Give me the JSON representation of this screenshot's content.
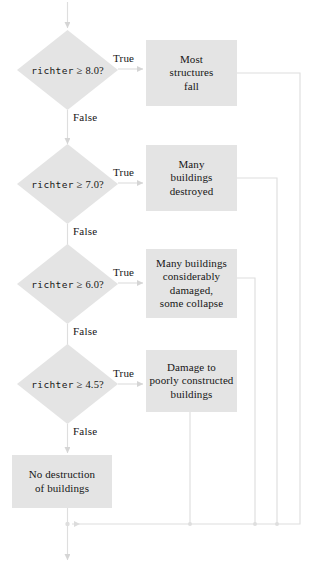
{
  "diagram": {
    "type": "flowchart",
    "colors": {
      "node_fill": "#e4e4e4",
      "edge_stroke": "#d8d8d8",
      "text": "#161616",
      "background": "#ffffff"
    },
    "decisions": [
      {
        "id": "d1",
        "variable": "richter",
        "operator": "≥",
        "threshold": "8.0?",
        "text": "richter ≥ 8.0?"
      },
      {
        "id": "d2",
        "variable": "richter",
        "operator": "≥",
        "threshold": "7.0?",
        "text": "richter ≥ 7.0?"
      },
      {
        "id": "d3",
        "variable": "richter",
        "operator": "≥",
        "threshold": "6.0?",
        "text": "richter ≥ 6.0?"
      },
      {
        "id": "d4",
        "variable": "richter",
        "operator": "≥",
        "threshold": "4.5?",
        "text": "richter ≥ 4.5?"
      }
    ],
    "outcomes": [
      {
        "id": "o1",
        "lines": [
          "Most",
          "structures",
          "fall"
        ]
      },
      {
        "id": "o2",
        "lines": [
          "Many",
          "buildings",
          "destroyed"
        ]
      },
      {
        "id": "o3",
        "lines": [
          "Many buildings",
          "considerably",
          "damaged,",
          "some collapse"
        ]
      },
      {
        "id": "o4",
        "lines": [
          "Damage to",
          "poorly constructed",
          "buildings"
        ]
      },
      {
        "id": "o5",
        "lines": [
          "No destruction",
          "of buildings"
        ]
      }
    ],
    "edge_labels": {
      "true": "True",
      "false": "False"
    },
    "branches": [
      {
        "decision": "d1",
        "true_label": "True",
        "true_target": "o1",
        "false_label": "False",
        "false_target": "d2"
      },
      {
        "decision": "d2",
        "true_label": "True",
        "true_target": "o2",
        "false_label": "False",
        "false_target": "d3"
      },
      {
        "decision": "d3",
        "true_label": "True",
        "true_target": "o3",
        "false_label": "False",
        "false_target": "d4"
      },
      {
        "decision": "d4",
        "true_label": "True",
        "true_target": "o4",
        "false_label": "False",
        "false_target": "o5"
      }
    ]
  }
}
